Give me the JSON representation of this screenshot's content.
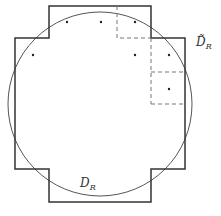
{
  "diagram": {
    "outer_polygon_label": "D̃",
    "outer_polygon_subscript": "R",
    "circle_label": "D",
    "circle_subscript": "R",
    "colors": {
      "stroke": "#333333",
      "circle": "#555555",
      "dashed": "#777777"
    },
    "dots": [
      [
        33,
        55
      ],
      [
        67,
        22
      ],
      [
        101,
        22
      ],
      [
        135,
        22
      ],
      [
        135,
        55
      ],
      [
        169,
        55
      ],
      [
        169,
        89
      ]
    ]
  }
}
